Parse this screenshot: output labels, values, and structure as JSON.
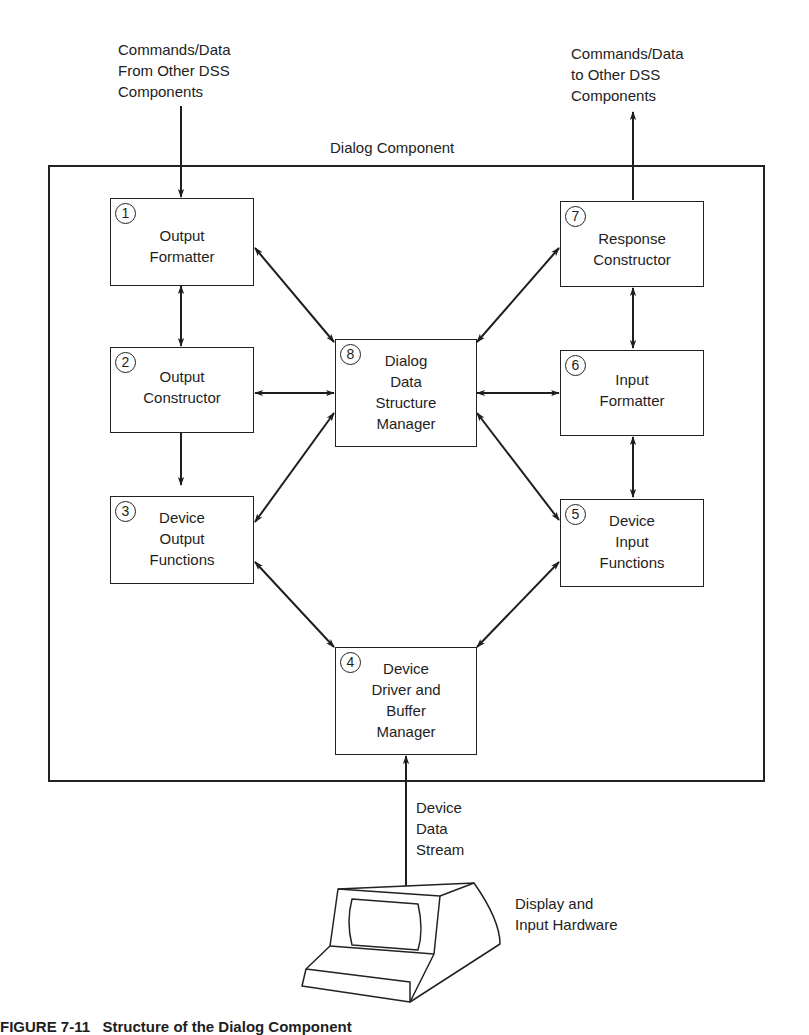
{
  "diagram": {
    "container_label": "Dialog Component",
    "inputs_label": [
      "Commands/Data",
      "From Other DSS",
      "Components"
    ],
    "outputs_label": [
      "Commands/Data",
      "to Other DSS",
      "Components"
    ],
    "stream_label": [
      "Device",
      "Data",
      "Stream"
    ],
    "hardware_label": [
      "Display and",
      "Input Hardware"
    ],
    "caption": "FIGURE 7-11   Structure of the Dialog Component",
    "boxes": [
      {
        "id": 1,
        "num": "1",
        "lines": [
          "Output",
          "Formatter"
        ]
      },
      {
        "id": 2,
        "num": "2",
        "lines": [
          "Output",
          "Constructor"
        ]
      },
      {
        "id": 3,
        "num": "3",
        "lines": [
          "Device",
          "Output",
          "Functions"
        ]
      },
      {
        "id": 4,
        "num": "4",
        "lines": [
          "Device",
          "Driver and",
          "Buffer",
          "Manager"
        ]
      },
      {
        "id": 5,
        "num": "5",
        "lines": [
          "Device",
          "Input",
          "Functions"
        ]
      },
      {
        "id": 6,
        "num": "6",
        "lines": [
          "Input",
          "Formatter"
        ]
      },
      {
        "id": 7,
        "num": "7",
        "lines": [
          "Response",
          "Constructor"
        ]
      },
      {
        "id": 8,
        "num": "8",
        "lines": [
          "Dialog",
          "Data",
          "Structure",
          "Manager"
        ]
      }
    ],
    "connections": [
      {
        "from": "external-in",
        "to": "1",
        "type": "one-way"
      },
      {
        "from": "1",
        "to": "2",
        "type": "bidirectional"
      },
      {
        "from": "2",
        "to": "3",
        "type": "bidirectional"
      },
      {
        "from": "1",
        "to": "8",
        "type": "bidirectional"
      },
      {
        "from": "2",
        "to": "8",
        "type": "bidirectional"
      },
      {
        "from": "3",
        "to": "8",
        "type": "bidirectional"
      },
      {
        "from": "3",
        "to": "4",
        "type": "bidirectional"
      },
      {
        "from": "4",
        "to": "5",
        "type": "bidirectional"
      },
      {
        "from": "5",
        "to": "8",
        "type": "bidirectional"
      },
      {
        "from": "6",
        "to": "8",
        "type": "bidirectional"
      },
      {
        "from": "7",
        "to": "8",
        "type": "bidirectional"
      },
      {
        "from": "5",
        "to": "6",
        "type": "bidirectional"
      },
      {
        "from": "6",
        "to": "7",
        "type": "bidirectional"
      },
      {
        "from": "7",
        "to": "external-out",
        "type": "one-way"
      },
      {
        "from": "4",
        "to": "hardware",
        "type": "bidirectional"
      }
    ]
  }
}
